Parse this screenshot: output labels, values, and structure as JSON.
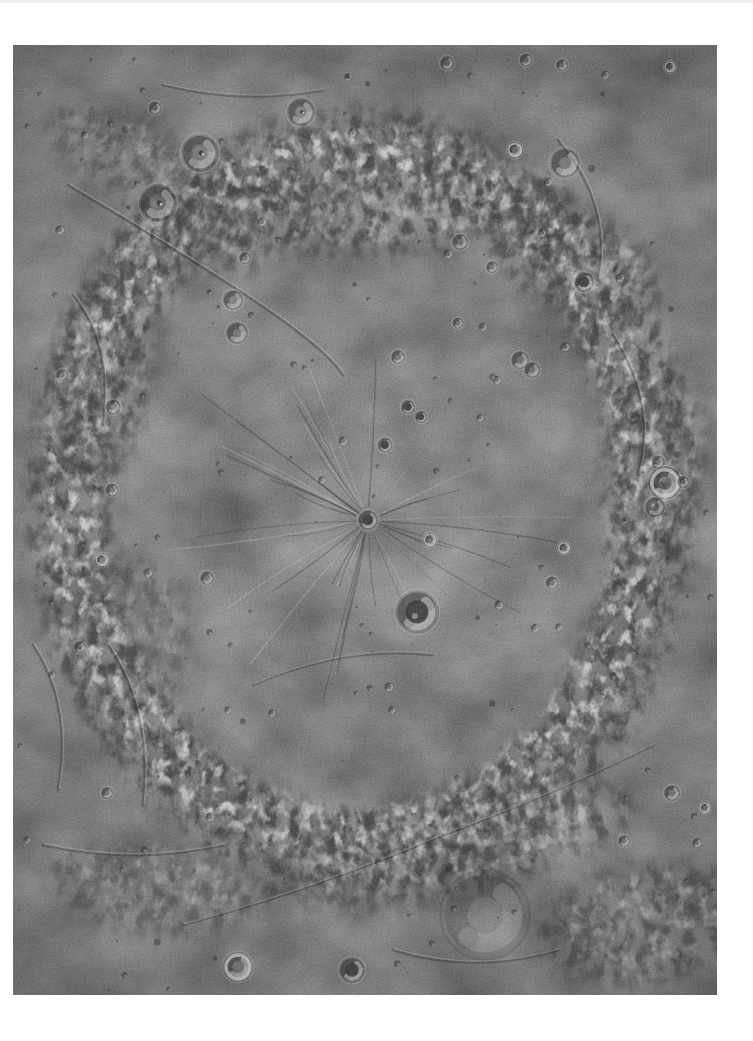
{
  "page": {
    "background": "#ffffff",
    "top_edge_color": "#f1f1f1"
  },
  "photo": {
    "description": "Grayscale orbital mosaic of Mercury's Caloris basin: heavily textured volcanic plains with the radial troughs of Pantheon Fossae spreading from the small dark-floored crater Apollodorus at center, the larger dark-floored crater Atget below center, scattered bowl craters of many sizes, and rough hummocky basin-rim mountains framing the smoother interior plains, all surrounded by a white paper margin.",
    "left": 13,
    "top": 45,
    "width": 704,
    "height": 950,
    "palette": {
      "base": "#828282",
      "floor_light": "#8e8e8e",
      "edge_dark": "#777777",
      "shadow": "#2e2e2e",
      "highlight": "#dadada",
      "dark_floor": "#4e4e4e"
    },
    "basin": {
      "center_x": 348,
      "center_y": 455,
      "radius_x": 292,
      "radius_y": 350
    },
    "pantheon_fossae": {
      "center_x": 355,
      "center_y": 475,
      "trough_count": 46,
      "min_length": 55,
      "max_length": 215,
      "ring_fracture_radii": [
        95,
        132,
        168
      ]
    },
    "craters": [
      [
        187,
        108,
        38,
        "peak"
      ],
      [
        145,
        158,
        38,
        "peak"
      ],
      [
        288,
        67,
        28,
        "peak"
      ],
      [
        142,
        63,
        13,
        "bowl"
      ],
      [
        335,
        32,
        8,
        "dark"
      ],
      [
        339,
        88,
        10,
        "bowl"
      ],
      [
        434,
        18,
        14,
        "bowl"
      ],
      [
        513,
        15,
        13,
        "bowl"
      ],
      [
        549,
        20,
        12,
        "bowl"
      ],
      [
        657,
        22,
        12,
        "bright"
      ],
      [
        592,
        30,
        9,
        "bowl"
      ],
      [
        552,
        118,
        30,
        "bowl"
      ],
      [
        502,
        105,
        16,
        "bright"
      ],
      [
        535,
        137,
        9,
        "bowl"
      ],
      [
        571,
        237,
        20,
        "dark"
      ],
      [
        607,
        233,
        10,
        "bowl"
      ],
      [
        447,
        197,
        16,
        "bowl"
      ],
      [
        435,
        209,
        10,
        "bowl"
      ],
      [
        479,
        222,
        12,
        "bowl"
      ],
      [
        529,
        188,
        9,
        "bowl"
      ],
      [
        220,
        255,
        20,
        "bowl"
      ],
      [
        224,
        288,
        22,
        "bowl"
      ],
      [
        232,
        213,
        12,
        "bowl"
      ],
      [
        249,
        177,
        10,
        "bowl"
      ],
      [
        330,
        396,
        10,
        "bowl"
      ],
      [
        372,
        400,
        15,
        "dark"
      ],
      [
        395,
        362,
        14,
        "dark"
      ],
      [
        408,
        372,
        12,
        "dark"
      ],
      [
        385,
        312,
        14,
        "bowl"
      ],
      [
        445,
        278,
        11,
        "bowl"
      ],
      [
        470,
        282,
        9,
        "bowl"
      ],
      [
        484,
        335,
        9,
        "bowl"
      ],
      [
        552,
        302,
        10,
        "bowl"
      ],
      [
        467,
        373,
        8,
        "bowl"
      ],
      [
        507,
        315,
        18,
        "bowl"
      ],
      [
        519,
        325,
        16,
        "bowl"
      ],
      [
        417,
        495,
        14,
        "bright"
      ],
      [
        355,
        475,
        20,
        "dark"
      ],
      [
        404,
        567,
        44,
        "dark"
      ],
      [
        309,
        435,
        8,
        "bowl"
      ],
      [
        100,
        362,
        15,
        "bowl"
      ],
      [
        99,
        445,
        13,
        "bowl"
      ],
      [
        49,
        330,
        12,
        "bowl"
      ],
      [
        89,
        515,
        14,
        "bright"
      ],
      [
        135,
        528,
        10,
        "bowl"
      ],
      [
        194,
        533,
        14,
        "bowl"
      ],
      [
        67,
        602,
        12,
        "bowl"
      ],
      [
        39,
        630,
        8,
        "bowl"
      ],
      [
        551,
        503,
        13,
        "bright"
      ],
      [
        539,
        538,
        13,
        "bowl"
      ],
      [
        601,
        547,
        22,
        "ghost"
      ],
      [
        486,
        560,
        10,
        "bowl"
      ],
      [
        522,
        583,
        9,
        "bowl"
      ],
      [
        546,
        582,
        8,
        "bowl"
      ],
      [
        652,
        438,
        33,
        "bright"
      ],
      [
        645,
        417,
        13,
        "bowl"
      ],
      [
        670,
        437,
        12,
        "bowl"
      ],
      [
        642,
        462,
        20,
        "bowl"
      ],
      [
        612,
        475,
        7,
        "dark"
      ],
      [
        659,
        748,
        16,
        "bowl"
      ],
      [
        692,
        763,
        12,
        "bright"
      ],
      [
        611,
        796,
        12,
        "bowl"
      ],
      [
        684,
        798,
        10,
        "bowl"
      ],
      [
        376,
        642,
        10,
        "bowl"
      ],
      [
        379,
        665,
        8,
        "bowl"
      ],
      [
        225,
        922,
        30,
        "bright"
      ],
      [
        339,
        925,
        26,
        "dark"
      ],
      [
        472,
        870,
        90,
        "ghost"
      ],
      [
        94,
        748,
        12,
        "bowl"
      ],
      [
        14,
        795,
        8,
        "bowl"
      ],
      [
        197,
        772,
        10,
        "bowl"
      ],
      [
        215,
        665,
        8,
        "bowl"
      ],
      [
        259,
        668,
        8,
        "bowl"
      ],
      [
        72,
        90,
        8,
        "bowl"
      ],
      [
        122,
        15,
        6,
        "bowl"
      ],
      [
        47,
        185,
        10,
        "bowl"
      ]
    ],
    "ridges": [
      "M55,140 Q140,190 225,245 T330,330",
      "M20,600 Q60,660 45,745",
      "M95,600 Q140,665 130,760",
      "M30,800 Q120,820 210,800",
      "M170,880 Q300,845 430,790",
      "M430,790 Q540,750 640,700",
      "M545,95 Q600,160 585,235",
      "M600,290 Q645,360 625,430",
      "M240,640 Q330,600 420,610",
      "M60,250 Q100,300 90,380",
      "M150,40 Q230,60 310,45",
      "M380,905 Q460,930 545,905"
    ],
    "dark_patches": [
      {
        "x": 350,
        "y": 165,
        "rx": 210,
        "ry": 45,
        "rot": -2,
        "o": 0.75
      },
      {
        "x": 180,
        "y": 190,
        "rx": 80,
        "ry": 35,
        "rot": 15,
        "o": 0.6
      },
      {
        "x": 560,
        "y": 215,
        "rx": 95,
        "ry": 50,
        "rot": 25,
        "o": 0.7
      },
      {
        "x": 640,
        "y": 420,
        "rx": 55,
        "ry": 110,
        "rot": 5,
        "o": 0.55
      },
      {
        "x": 90,
        "y": 330,
        "rx": 50,
        "ry": 115,
        "rot": 8,
        "o": 0.6
      },
      {
        "x": 120,
        "y": 600,
        "rx": 60,
        "ry": 90,
        "rot": 0,
        "o": 0.35
      },
      {
        "x": 430,
        "y": 800,
        "rx": 195,
        "ry": 55,
        "rot": -12,
        "o": 0.7
      },
      {
        "x": 630,
        "y": 880,
        "rx": 110,
        "ry": 60,
        "rot": -8,
        "o": 0.6
      },
      {
        "x": 140,
        "y": 845,
        "rx": 110,
        "ry": 45,
        "rot": 8,
        "o": 0.5
      },
      {
        "x": 120,
        "y": 115,
        "rx": 95,
        "ry": 40,
        "rot": 28,
        "o": 0.5
      }
    ],
    "bright_patches": [
      {
        "x": 290,
        "y": 60,
        "r": 26,
        "o": 0.14
      },
      {
        "x": 187,
        "y": 100,
        "r": 22,
        "o": 0.12
      },
      {
        "x": 571,
        "y": 237,
        "r": 14,
        "o": 0.2
      },
      {
        "x": 404,
        "y": 567,
        "r": 40,
        "o": 0.14
      },
      {
        "x": 300,
        "y": 868,
        "r": 26,
        "o": 0.18
      },
      {
        "x": 560,
        "y": 820,
        "r": 30,
        "o": 0.12
      },
      {
        "x": 225,
        "y": 922,
        "r": 16,
        "o": 0.18
      },
      {
        "x": 89,
        "y": 515,
        "r": 10,
        "o": 0.2
      },
      {
        "x": 645,
        "y": 95,
        "r": 30,
        "o": 0.1
      },
      {
        "x": 350,
        "y": 470,
        "r": 60,
        "o": 0.08
      },
      {
        "x": 472,
        "y": 905,
        "r": 40,
        "o": 0.1
      }
    ],
    "craterlets": {
      "count": 135,
      "seed": 42,
      "min_d": 2,
      "max_d": 7
    }
  }
}
